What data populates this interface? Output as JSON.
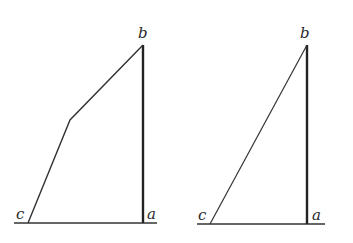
{
  "figures": [
    {
      "name": "left-figure",
      "labels": {
        "b": "b",
        "c": "c",
        "a": "a"
      },
      "points": {
        "b": [
          143,
          45
        ],
        "bend": [
          70,
          120
        ],
        "c": [
          28,
          222
        ],
        "a": [
          143,
          222
        ]
      },
      "baseline": [
        14,
        157
      ]
    },
    {
      "name": "right-figure",
      "labels": {
        "b": "b",
        "c": "c",
        "a": "a"
      },
      "points": {
        "b": [
          307,
          45
        ],
        "c": [
          210,
          223
        ],
        "a": [
          307,
          223
        ]
      },
      "baseline": [
        197,
        325
      ]
    }
  ],
  "colors": {
    "line": "#333333",
    "background": "#ffffff"
  }
}
